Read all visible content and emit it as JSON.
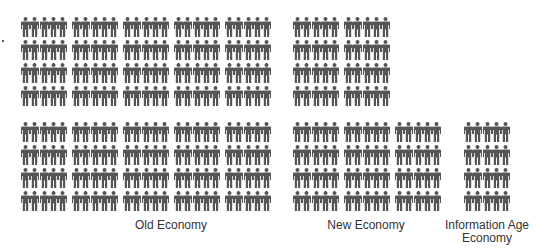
{
  "chart_data": {
    "type": "pictogram",
    "title": "",
    "unit": "Each figure represents one person; each cell contains 5 figures",
    "figures_per_cell": 5,
    "glyph_color": "#555555",
    "categories": [
      "Old Economy",
      "New Economy",
      "Information Age Economy"
    ],
    "values": [
      200,
      100,
      20
    ],
    "cells": [
      40,
      20,
      4
    ],
    "groups": [
      {
        "label": "Old Economy",
        "columns": 5,
        "rows_per_column": [
          8,
          8,
          8,
          8,
          8
        ],
        "people": 200
      },
      {
        "label": "New Economy",
        "columns": 3,
        "rows_per_column": [
          8,
          8,
          4
        ],
        "people": 100
      },
      {
        "label": "Information Age\nEconomy",
        "columns": 1,
        "rows_per_column": [
          4
        ],
        "people": 20
      }
    ],
    "grid": false,
    "legend": null
  },
  "labels": {
    "old": "Old Economy",
    "new": "New Economy",
    "info": "Information Age\nEconomy"
  }
}
